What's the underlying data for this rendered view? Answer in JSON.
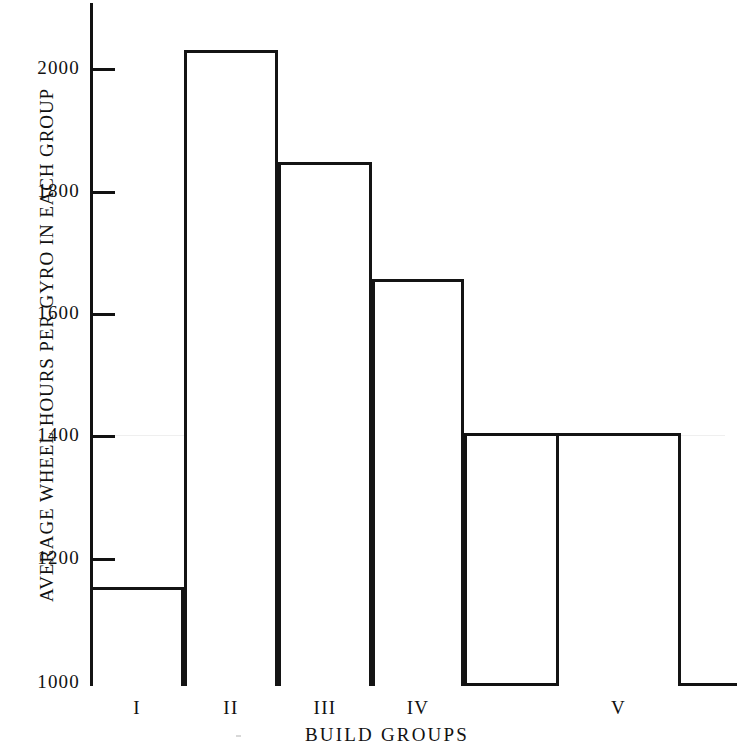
{
  "chart_data": {
    "type": "bar",
    "title": "",
    "xlabel": "BUILD GROUPS",
    "ylabel": "AVERAGE WHEEL HOURS PER GYRO IN EACH GROUP",
    "categories": [
      "I",
      "II",
      "III",
      "IV",
      "V"
    ],
    "values": [
      1160,
      2030,
      1850,
      1660,
      1410
    ],
    "ylim": [
      1000,
      2100
    ],
    "yticks": [
      1000,
      1200,
      1400,
      1600,
      1800,
      2000
    ],
    "ytick_labels": [
      "1000",
      "1200",
      "1400",
      "1600",
      "1800",
      "2000"
    ],
    "grid": false,
    "legend": null,
    "bar_style": {
      "fill": "#ffffff",
      "stroke": "#141414",
      "stroke_width": 3
    },
    "bar_extents": [
      {
        "category": "I",
        "x_start": 90,
        "x_end": 184,
        "value": 1160
      },
      {
        "category": "II",
        "x_start": 184,
        "x_end": 278,
        "value": 2030
      },
      {
        "category": "III",
        "x_start": 278,
        "x_end": 372,
        "value": 1850
      },
      {
        "category": "IV",
        "x_start": 372,
        "x_end": 464,
        "value": 1660
      },
      {
        "category": "V",
        "x_start": 556,
        "x_end": 681,
        "value": 1410
      }
    ],
    "axis_color": "#121212",
    "background": "#ffffff"
  },
  "figure": {
    "y_axis_title": "AVERAGE WHEEL HOURS PER GYRO IN EACH GROUP",
    "x_axis_title": "BUILD GROUPS",
    "y_tick_labels": [
      "2000",
      "1800",
      "1600",
      "1400",
      "1200",
      "1000"
    ],
    "x_tick_labels": [
      "I",
      "II",
      "III",
      "IV",
      "V"
    ]
  }
}
